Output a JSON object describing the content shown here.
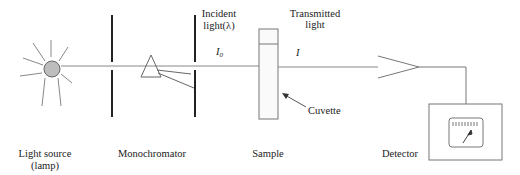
{
  "diagram": {
    "title": "",
    "components": {
      "light_source": {
        "label_line1": "Light source",
        "label_line2": "(lamp)"
      },
      "monochromator": {
        "label": "Monochromator"
      },
      "sample": {
        "label": "Sample",
        "cuvette_label": "Cuvette"
      },
      "detector": {
        "label": "Detector"
      }
    },
    "beam_labels": {
      "incident_line1": "Incident",
      "incident_line2": "light(λ)",
      "incident_symbol": "I",
      "incident_subscript": "0",
      "transmitted_line1": "Transmitted",
      "transmitted_line2": "light",
      "transmitted_symbol": "I"
    },
    "colors": {
      "line": "#777777",
      "slit": "#222222",
      "lamp_fill": "#bdbdbd",
      "text": "#222222"
    }
  }
}
